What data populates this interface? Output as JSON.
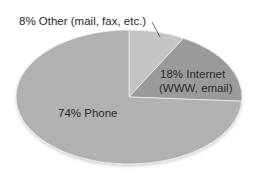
{
  "chart_data": {
    "type": "pie",
    "title": "",
    "slices": [
      {
        "label": "Other (mail, fax, etc.)",
        "value": 8,
        "display": "8% Other (mail, fax, etc.)",
        "color": "#c4c4c4"
      },
      {
        "label": "Internet (WWW, email)",
        "value": 18,
        "display_line1": "18% Internet",
        "display_line2": "(WWW, email)",
        "color": "#9a9a9a"
      },
      {
        "label": "Phone",
        "value": 74,
        "display": "74% Phone",
        "color": "#b1b1b1"
      }
    ],
    "legend": "none",
    "start_angle": "12 o'clock, clockwise"
  },
  "labels": {
    "other": "8% Other (mail, fax, etc.)",
    "internet_line1": "18% Internet",
    "internet_line2": "(WWW, email)",
    "phone": "74% Phone"
  }
}
